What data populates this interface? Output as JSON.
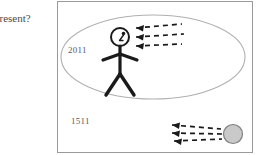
{
  "canvas": {
    "width": 260,
    "height": 155,
    "background": "#ffffff"
  },
  "caption": {
    "text": "present?",
    "note": "clipped at left edge of screenshot"
  },
  "panel": {
    "border_color": "#9a9a9a",
    "background": "#ffffff"
  },
  "diagram": {
    "ellipse": {
      "name": "present-era-ellipse",
      "stroke": "#b0b0b0",
      "fill": "none",
      "cx": 95,
      "cy": 55,
      "rx": 92,
      "ry": 42
    },
    "labels": {
      "upper": "2011",
      "lower": "1511",
      "color": "#5a5a5a"
    },
    "stick_figure": {
      "name": "stick-figure-observer",
      "stroke": "#1a1a1a",
      "head_cx": 62,
      "head_cy": 35,
      "head_r": 9
    },
    "sphere": {
      "name": "gray-sphere",
      "fill": "#c9c9c9",
      "stroke": "#808080",
      "cx": 175,
      "cy": 132,
      "r": 9
    },
    "arrow_groups": [
      {
        "name": "arrows-to-figure",
        "count": 3,
        "direction": "left",
        "style": "dashed",
        "color": "#1a1a1a"
      },
      {
        "name": "arrows-from-sphere",
        "count": 3,
        "direction": "left",
        "style": "dashed",
        "color": "#1a1a1a"
      }
    ]
  }
}
